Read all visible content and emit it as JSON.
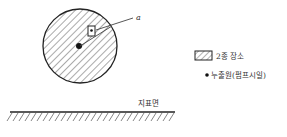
{
  "diagram": {
    "label_a": "a",
    "legend": {
      "zone_label": "2종 장소",
      "source_label": "누출원(펌프시일)"
    },
    "ground_label": "지표면"
  }
}
